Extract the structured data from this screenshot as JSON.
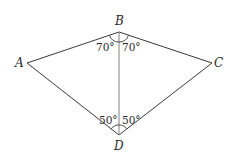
{
  "diagram": {
    "type": "quadrilateral (kite) with diagonal BD",
    "vertices": [
      {
        "name": "A",
        "x": 27,
        "y": 63
      },
      {
        "name": "B",
        "x": 119,
        "y": 32
      },
      {
        "name": "C",
        "x": 212,
        "y": 63
      },
      {
        "name": "D",
        "x": 119,
        "y": 135
      }
    ],
    "labels": {
      "A": "A",
      "B": "B",
      "C": "C",
      "D": "D"
    },
    "angles": {
      "ABD": "70°",
      "DBC": "70°",
      "ADB": "50°",
      "BDC": "50°"
    },
    "segments": [
      "AB",
      "BC",
      "CD",
      "DA",
      "BD"
    ]
  }
}
